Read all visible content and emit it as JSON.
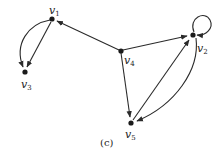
{
  "diagram": {
    "type": "directed-graph",
    "caption": "(c)",
    "nodes": [
      {
        "id": "v1",
        "base": "v",
        "sub": "1",
        "x": 52,
        "y": 19,
        "lx": 47,
        "ly": 13
      },
      {
        "id": "v2",
        "base": "v",
        "sub": "2",
        "x": 193,
        "y": 35,
        "lx": 196,
        "ly": 52
      },
      {
        "id": "v3",
        "base": "v",
        "sub": "3",
        "x": 25,
        "y": 72,
        "lx": 20,
        "ly": 89
      },
      {
        "id": "v4",
        "base": "v",
        "sub": "4",
        "x": 121,
        "y": 51,
        "lx": 123,
        "ly": 66
      },
      {
        "id": "v5",
        "base": "v",
        "sub": "5",
        "x": 131,
        "y": 123,
        "lx": 124,
        "ly": 140
      }
    ],
    "edges": [
      {
        "from": "v1",
        "to": "v3",
        "style": "curved-left"
      },
      {
        "from": "v1",
        "to": "v3",
        "style": "straight"
      },
      {
        "from": "v4",
        "to": "v1",
        "style": "straight"
      },
      {
        "from": "v4",
        "to": "v2",
        "style": "straight"
      },
      {
        "from": "v4",
        "to": "v5",
        "style": "straight"
      },
      {
        "from": "v5",
        "to": "v2",
        "style": "straight"
      },
      {
        "from": "v2",
        "to": "v5",
        "style": "curved-right"
      },
      {
        "from": "v2",
        "to": "v2",
        "style": "self-loop"
      }
    ]
  },
  "labels": {
    "v1": {
      "base": "v",
      "sub": "1"
    },
    "v2": {
      "base": "v",
      "sub": "2"
    },
    "v3": {
      "base": "v",
      "sub": "3"
    },
    "v4": {
      "base": "v",
      "sub": "4"
    },
    "v5": {
      "base": "v",
      "sub": "5"
    }
  },
  "caption": "(c)"
}
